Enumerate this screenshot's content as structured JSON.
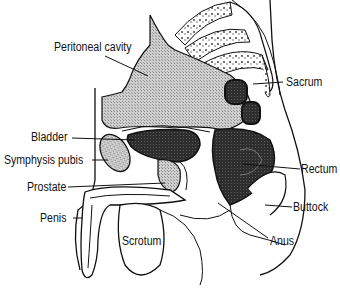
{
  "diagram": {
    "labels": [
      {
        "id": "peritoneal-cavity",
        "text": "Peritoneal cavity",
        "x": 54,
        "y": 40
      },
      {
        "id": "sacrum",
        "text": "Sacrum",
        "x": 286,
        "y": 75
      },
      {
        "id": "bladder",
        "text": "Bladder",
        "x": 31,
        "y": 130
      },
      {
        "id": "symphysis-pubis",
        "text": "Symphysis pubis",
        "x": 4,
        "y": 153
      },
      {
        "id": "rectum",
        "text": "Rectum",
        "x": 301,
        "y": 162
      },
      {
        "id": "prostate",
        "text": "Prostate",
        "x": 27,
        "y": 180
      },
      {
        "id": "buttock",
        "text": "Buttock",
        "x": 293,
        "y": 200
      },
      {
        "id": "penis",
        "text": "Penis",
        "x": 40,
        "y": 211
      },
      {
        "id": "scrotum",
        "text": "Scrotum",
        "x": 122,
        "y": 234
      },
      {
        "id": "anus",
        "text": "Anus",
        "x": 270,
        "y": 234
      }
    ],
    "colors": {
      "line": "#111111",
      "stipple": "#b8b8b8",
      "dark": "#3a3a3a",
      "background": "#ffffff"
    }
  }
}
